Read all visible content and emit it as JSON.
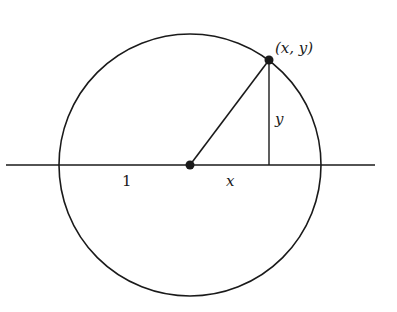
{
  "diagram": {
    "type": "unit-circle",
    "colors": {
      "stroke": "#1a1a1a",
      "background": "#ffffff"
    },
    "geometry": {
      "center": [
        190,
        165
      ],
      "radius": 131,
      "axis": {
        "x1": 6,
        "x2": 375,
        "y": 165
      },
      "point": [
        269,
        60
      ],
      "foot": [
        269,
        165
      ]
    },
    "labels": {
      "point": "(x, y)",
      "radius_segment": "1",
      "x_segment": "x",
      "y_segment": "y"
    }
  }
}
